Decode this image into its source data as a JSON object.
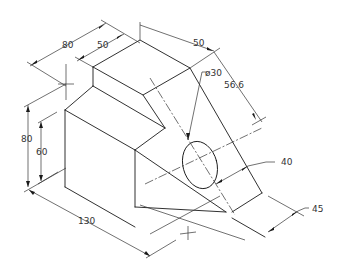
{
  "drawing": {
    "type": "isometric mechanical drawing",
    "dimensions": {
      "top_depth_total": "80",
      "top_depth_upper": "50",
      "slant_width": "50",
      "hole_diameter": "ø30",
      "slant_length": "56.6",
      "hole_offset": "40",
      "base_offset": "45",
      "height_total": "80",
      "height_lower": "60",
      "length_total": "130"
    }
  }
}
